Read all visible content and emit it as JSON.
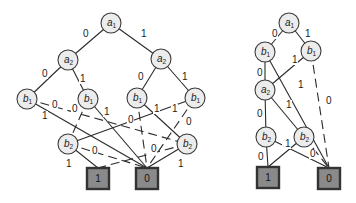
{
  "diagram": {
    "type": "binary decision diagrams",
    "left": {
      "nodes": [
        {
          "id": "a1",
          "var": "a",
          "sub": "1",
          "x": 111,
          "y": 23
        },
        {
          "id": "a2L",
          "var": "a",
          "sub": "2",
          "x": 68,
          "y": 60
        },
        {
          "id": "a2R",
          "var": "a",
          "sub": "2",
          "x": 161,
          "y": 59
        },
        {
          "id": "b1A",
          "var": "b",
          "sub": "1",
          "x": 27,
          "y": 99
        },
        {
          "id": "b1B",
          "var": "b",
          "sub": "1",
          "x": 88,
          "y": 99
        },
        {
          "id": "b1C",
          "var": "b",
          "sub": "1",
          "x": 137,
          "y": 98
        },
        {
          "id": "b1D",
          "var": "b",
          "sub": "1",
          "x": 195,
          "y": 98
        },
        {
          "id": "b2L",
          "var": "b",
          "sub": "2",
          "x": 68,
          "y": 144
        },
        {
          "id": "b2R",
          "var": "b",
          "sub": "2",
          "x": 187,
          "y": 144
        }
      ],
      "terminals": [
        {
          "id": "T1",
          "label": "1",
          "x": 87,
          "y": 168,
          "w": 22,
          "h": 21
        },
        {
          "id": "T0",
          "label": "0",
          "x": 136,
          "y": 168,
          "w": 22,
          "h": 21
        }
      ],
      "edges": [
        {
          "from": "a1",
          "to": "a2L",
          "label": "0",
          "dashed": false,
          "lx": 83,
          "ly": 37
        },
        {
          "from": "a1",
          "to": "a2R",
          "label": "1",
          "dashed": false,
          "lx": 141,
          "ly": 37
        },
        {
          "from": "a2L",
          "to": "b1A",
          "label": "0",
          "dashed": false,
          "lx": 42,
          "ly": 77
        },
        {
          "from": "a2L",
          "to": "b1B",
          "label": "1",
          "dashed": false,
          "lx": 80,
          "ly": 82
        },
        {
          "from": "a2R",
          "to": "b1C",
          "label": "0",
          "dashed": false,
          "lx": 138,
          "ly": 80
        },
        {
          "from": "a2R",
          "to": "b1D",
          "label": "1",
          "dashed": false,
          "lx": 182,
          "ly": 80
        },
        {
          "from": "b1A",
          "to": "b2R",
          "label": "0",
          "dashed": true,
          "lx": 52,
          "ly": 108
        },
        {
          "from": "b1A",
          "to": "T0",
          "label": "1",
          "dashed": false,
          "lx": 42,
          "ly": 119
        },
        {
          "from": "b1B",
          "to": "b2L",
          "label": "0",
          "dashed": true,
          "lx": 72,
          "ly": 112
        },
        {
          "from": "b1B",
          "to": "T0",
          "label": "1",
          "dashed": false,
          "lx": 104,
          "ly": 115
        },
        {
          "from": "b1C",
          "to": "T0",
          "label": "0",
          "dashed": true,
          "lx": 128,
          "ly": 123
        },
        {
          "from": "b1C",
          "to": "b2R",
          "label": "1",
          "dashed": false,
          "lx": 154,
          "ly": 112
        },
        {
          "from": "b1D",
          "to": "b2L",
          "label": "1",
          "dashed": false,
          "lx": 172,
          "ly": 112
        },
        {
          "from": "b1D",
          "to": "T0",
          "label": "0",
          "dashed": true,
          "lx": 186,
          "ly": 125
        },
        {
          "from": "b2L",
          "to": "T1",
          "label": "1",
          "dashed": false,
          "lx": 66,
          "ly": 167
        },
        {
          "from": "b2L",
          "to": "T0",
          "label": "0",
          "dashed": true,
          "lx": 92,
          "ly": 154
        },
        {
          "from": "b2R",
          "to": "T1",
          "label": "0",
          "dashed": true,
          "lx": 151,
          "ly": 152
        },
        {
          "from": "b2R",
          "to": "T0",
          "label": "1",
          "dashed": false,
          "lx": 178,
          "ly": 167
        }
      ]
    },
    "right": {
      "nodes": [
        {
          "id": "a1",
          "var": "a",
          "sub": "1",
          "x": 289,
          "y": 23
        },
        {
          "id": "b1L",
          "var": "b",
          "sub": "1",
          "x": 265,
          "y": 52
        },
        {
          "id": "b1R",
          "var": "b",
          "sub": "1",
          "x": 311,
          "y": 51
        },
        {
          "id": "a2",
          "var": "a",
          "sub": "2",
          "x": 265,
          "y": 90
        },
        {
          "id": "b2L",
          "var": "b",
          "sub": "2",
          "x": 266,
          "y": 137
        },
        {
          "id": "b2R",
          "var": "b",
          "sub": "2",
          "x": 304,
          "y": 137
        }
      ],
      "terminals": [
        {
          "id": "T1",
          "label": "1",
          "x": 257,
          "y": 167,
          "w": 22,
          "h": 21
        },
        {
          "id": "T0",
          "label": "0",
          "x": 318,
          "y": 168,
          "w": 22,
          "h": 21
        }
      ],
      "edges": [
        {
          "from": "a1",
          "to": "b1L",
          "label": "0",
          "dashed": false,
          "lx": 272,
          "ly": 37
        },
        {
          "from": "a1",
          "to": "b1R",
          "label": "1",
          "dashed": false,
          "lx": 305,
          "ly": 37
        },
        {
          "from": "b1L",
          "to": "a2",
          "label": "0",
          "dashed": false,
          "lx": 257,
          "ly": 76
        },
        {
          "from": "b1L",
          "to": "T0",
          "label": "1",
          "dashed": false,
          "lx": 298,
          "ly": 88
        },
        {
          "from": "b1R",
          "to": "a2",
          "label": "1",
          "dashed": false,
          "lx": 292,
          "ly": 63
        },
        {
          "from": "b1R",
          "to": "T0",
          "label": "0",
          "dashed": true,
          "lx": 326,
          "ly": 104
        },
        {
          "from": "a2",
          "to": "b2L",
          "label": "0",
          "dashed": false,
          "lx": 257,
          "ly": 117
        },
        {
          "from": "a2",
          "to": "b2R",
          "label": "1",
          "dashed": false,
          "lx": 286,
          "ly": 108
        },
        {
          "from": "b2L",
          "to": "T1",
          "label": "0",
          "dashed": false,
          "lx": 258,
          "ly": 160
        },
        {
          "from": "b2L",
          "to": "T0",
          "label": "1",
          "dashed": false,
          "lx": 283,
          "ly": 147
        },
        {
          "from": "b2R",
          "to": "T1",
          "label": "1",
          "dashed": false,
          "lx": 285,
          "ly": 147
        },
        {
          "from": "b2R",
          "to": "T0",
          "label": "0",
          "dashed": true,
          "lx": 310,
          "ly": 157
        }
      ]
    }
  },
  "colors": {
    "node_fill": "#ececec",
    "terminal_fill": "#8a8a8a",
    "stroke": "#2b2b2b"
  }
}
